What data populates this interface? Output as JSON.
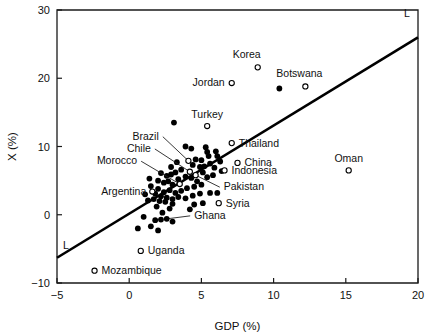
{
  "chart_data": {
    "type": "scatter",
    "title": "",
    "xlabel": "GDP (%)",
    "ylabel": "X (%)",
    "xlim": [
      -5,
      20
    ],
    "ylim": [
      -10,
      30
    ],
    "xticks": [
      -5,
      0,
      5,
      10,
      15,
      20
    ],
    "yticks": [
      -10,
      0,
      10,
      20,
      30
    ],
    "xticklabels": [
      "−5",
      "0",
      "5",
      "10",
      "15",
      "20"
    ],
    "yticklabels": [
      "−10",
      "0",
      "10",
      "20",
      "30"
    ],
    "grid": false,
    "legend": null,
    "fit_line": {
      "label": "L",
      "label_start": "L",
      "label_end": "L",
      "x_start": -5,
      "y_start": -6.3,
      "x_end": 20,
      "y_end": 26.0
    },
    "annotations": [
      {
        "name": "Korea",
        "x": 8.9,
        "y": 21.6,
        "marker": "open",
        "label_dx": -11,
        "label_dy": -9,
        "anchor": "middle"
      },
      {
        "name": "Botswana",
        "x": 12.2,
        "y": 18.8,
        "marker": "open",
        "label_dx": -6,
        "label_dy": -9,
        "anchor": "middle"
      },
      {
        "name": "Jordan",
        "x": 7.1,
        "y": 19.3,
        "marker": "open",
        "label_dx": -7,
        "label_dy": 3,
        "anchor": "end"
      },
      {
        "name": "Turkey",
        "x": 5.4,
        "y": 13.0,
        "marker": "open",
        "label_dx": 0,
        "label_dy": -8,
        "anchor": "middle"
      },
      {
        "name": "Thailand",
        "x": 7.1,
        "y": 10.5,
        "marker": "open",
        "label_dx": 7,
        "label_dy": 3.5,
        "anchor": "start"
      },
      {
        "name": "China",
        "x": 7.5,
        "y": 7.6,
        "marker": "open",
        "label_dx": 7,
        "label_dy": 3.5,
        "anchor": "start"
      },
      {
        "name": "Indonesia",
        "x": 6.6,
        "y": 6.5,
        "marker": "open",
        "label_dx": 7,
        "label_dy": 3.5,
        "anchor": "start"
      },
      {
        "name": "Syria",
        "x": 6.2,
        "y": 1.7,
        "marker": "open",
        "label_dx": 7,
        "label_dy": 3.5,
        "anchor": "start"
      },
      {
        "name": "Oman",
        "x": 15.2,
        "y": 6.5,
        "marker": "open",
        "label_dx": 0,
        "label_dy": -8,
        "anchor": "middle"
      },
      {
        "name": "Uganda",
        "x": 0.8,
        "y": -5.3,
        "marker": "open",
        "label_dx": 7,
        "label_dy": 3.5,
        "anchor": "start"
      },
      {
        "name": "Mozambique",
        "x": -2.4,
        "y": -8.2,
        "marker": "open",
        "label_dx": 7,
        "label_dy": 3.5,
        "anchor": "start"
      },
      {
        "name": "Argentina",
        "x": 1.6,
        "y": 3.4,
        "marker": "open",
        "label_dx": -6,
        "label_dy": 3.5,
        "anchor": "end"
      }
    ],
    "leader_annotations": [
      {
        "name": "Brazil",
        "x": 4.1,
        "y": 7.9,
        "marker": "open",
        "text_x": 2.05,
        "text_y": 11.0,
        "anchor": "end"
      },
      {
        "name": "Chile",
        "x": 4.2,
        "y": 6.3,
        "marker": "open",
        "text_x": 1.5,
        "text_y": 9.2,
        "anchor": "end"
      },
      {
        "name": "Morocco",
        "x": 3.5,
        "y": 4.5,
        "marker": "open",
        "text_x": 0.55,
        "text_y": 7.4,
        "anchor": "end"
      },
      {
        "name": "Pakistan",
        "x": 4.6,
        "y": 5.8,
        "marker": "open",
        "text_x": 6.55,
        "text_y": 3.6,
        "anchor": "start"
      },
      {
        "name": "Ghana",
        "x": 2.6,
        "y": -0.6,
        "marker": "filled",
        "text_x": 4.5,
        "text_y": -0.6,
        "anchor": "start"
      }
    ],
    "unlabeled_points": [
      {
        "x": 3.1,
        "y": 13.5,
        "marker": "filled"
      },
      {
        "x": 10.4,
        "y": 18.5,
        "marker": "filled"
      },
      {
        "x": 3.9,
        "y": 10.0
      },
      {
        "x": 4.3,
        "y": 9.7
      },
      {
        "x": 5.3,
        "y": 9.9
      },
      {
        "x": 5.4,
        "y": 9.2
      },
      {
        "x": 5.5,
        "y": 8.6
      },
      {
        "x": 6.0,
        "y": 9.3
      },
      {
        "x": 6.1,
        "y": 8.6
      },
      {
        "x": 5.0,
        "y": 8.0
      },
      {
        "x": 4.6,
        "y": 8.1
      },
      {
        "x": 4.4,
        "y": 7.3
      },
      {
        "x": 4.9,
        "y": 7.0
      },
      {
        "x": 5.2,
        "y": 7.1
      },
      {
        "x": 5.6,
        "y": 7.5
      },
      {
        "x": 6.4,
        "y": 6.4
      },
      {
        "x": 3.6,
        "y": 6.6
      },
      {
        "x": 3.2,
        "y": 6.2
      },
      {
        "x": 2.9,
        "y": 5.9
      },
      {
        "x": 2.6,
        "y": 5.7
      },
      {
        "x": 2.2,
        "y": 6.1
      },
      {
        "x": 1.4,
        "y": 5.3
      },
      {
        "x": 2.0,
        "y": 5.0
      },
      {
        "x": 2.4,
        "y": 4.7
      },
      {
        "x": 2.7,
        "y": 4.9
      },
      {
        "x": 3.0,
        "y": 4.4
      },
      {
        "x": 3.4,
        "y": 5.2
      },
      {
        "x": 3.9,
        "y": 5.6
      },
      {
        "x": 4.3,
        "y": 5.4
      },
      {
        "x": 4.7,
        "y": 4.9
      },
      {
        "x": 5.1,
        "y": 6.2
      },
      {
        "x": 5.4,
        "y": 5.5
      },
      {
        "x": 5.8,
        "y": 5.8
      },
      {
        "x": 5.0,
        "y": 4.4
      },
      {
        "x": 4.5,
        "y": 4.1
      },
      {
        "x": 4.0,
        "y": 3.9
      },
      {
        "x": 3.6,
        "y": 3.5
      },
      {
        "x": 3.2,
        "y": 3.2
      },
      {
        "x": 2.8,
        "y": 3.6
      },
      {
        "x": 2.4,
        "y": 3.3
      },
      {
        "x": 2.0,
        "y": 3.8
      },
      {
        "x": 1.8,
        "y": 3.1
      },
      {
        "x": 2.2,
        "y": 2.7
      },
      {
        "x": 2.6,
        "y": 2.5
      },
      {
        "x": 3.0,
        "y": 2.3
      },
      {
        "x": 3.4,
        "y": 2.6
      },
      {
        "x": 3.9,
        "y": 2.4
      },
      {
        "x": 4.4,
        "y": 2.8
      },
      {
        "x": 4.9,
        "y": 3.1
      },
      {
        "x": 5.6,
        "y": 3.2
      },
      {
        "x": 6.1,
        "y": 3.2
      },
      {
        "x": 5.1,
        "y": 1.7
      },
      {
        "x": 4.5,
        "y": 1.5
      },
      {
        "x": 3.0,
        "y": 1.6
      },
      {
        "x": 2.5,
        "y": 1.9
      },
      {
        "x": 2.1,
        "y": 2.0
      },
      {
        "x": 1.7,
        "y": 2.3
      },
      {
        "x": 2.8,
        "y": 0.9
      },
      {
        "x": 2.3,
        "y": 0.3
      },
      {
        "x": 1.9,
        "y": 1.2
      },
      {
        "x": 1.3,
        "y": 2.1
      },
      {
        "x": 1.1,
        "y": 3.0
      },
      {
        "x": 1.5,
        "y": 4.2
      },
      {
        "x": 2.9,
        "y": 7.0
      },
      {
        "x": 3.3,
        "y": 7.7
      },
      {
        "x": 1.0,
        "y": -0.3
      },
      {
        "x": 1.8,
        "y": -0.8
      },
      {
        "x": 2.2,
        "y": -0.7
      },
      {
        "x": 3.0,
        "y": -1.0
      },
      {
        "x": 0.6,
        "y": -2.0
      },
      {
        "x": 2.0,
        "y": -2.3
      },
      {
        "x": 1.5,
        "y": -1.7
      },
      {
        "x": 5.9,
        "y": 6.9
      },
      {
        "x": 6.3,
        "y": 7.8
      },
      {
        "x": 4.2,
        "y": 0.8
      }
    ]
  }
}
